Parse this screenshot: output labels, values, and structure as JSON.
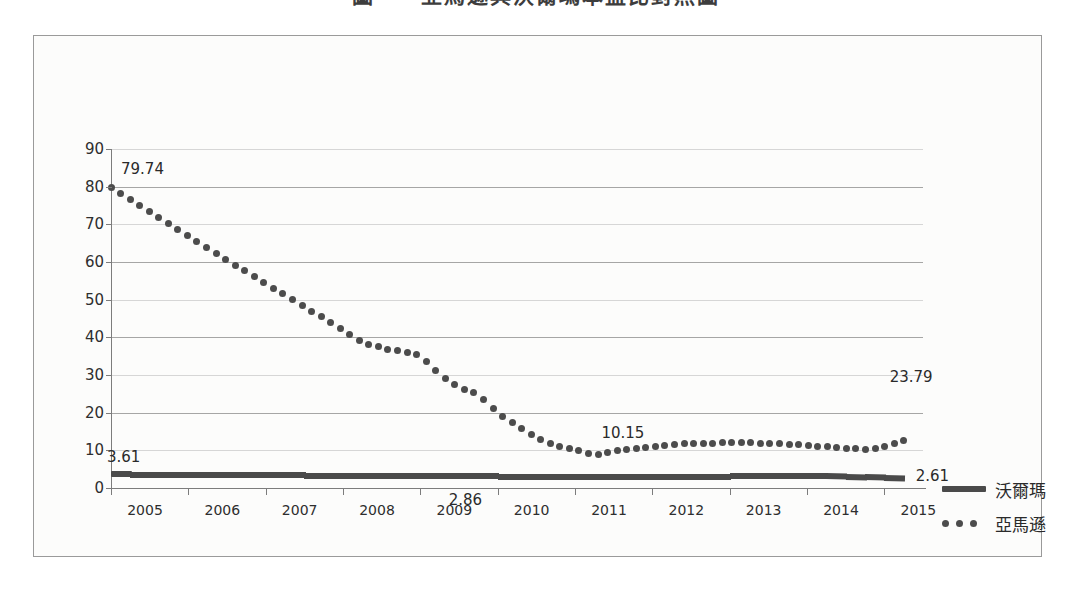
{
  "title": "圖一　亞馬遜與沃爾瑪本益比對照圖",
  "chart_data": {
    "type": "line",
    "title": "圖一　亞馬遜與沃爾瑪本益比對照圖",
    "xlabel": "",
    "ylabel": "",
    "ylim": [
      0,
      90
    ],
    "xlim": [
      2005,
      2015.5
    ],
    "grid": true,
    "legend_position": "right",
    "y_ticks": [
      0,
      10,
      20,
      30,
      40,
      50,
      60,
      70,
      80,
      90
    ],
    "x_ticks": [
      "2005",
      "2006",
      "2007",
      "2008",
      "2009",
      "2010",
      "2011",
      "2012",
      "2013",
      "2014",
      "2015"
    ],
    "x": [
      2005.0,
      2005.25,
      2005.5,
      2005.75,
      2006.0,
      2006.25,
      2006.5,
      2006.75,
      2007.0,
      2007.25,
      2007.5,
      2007.75,
      2008.0,
      2008.25,
      2008.5,
      2008.75,
      2009.0,
      2009.25,
      2009.5,
      2009.75,
      2010.0,
      2010.25,
      2010.5,
      2010.75,
      2011.0,
      2011.25,
      2011.5,
      2011.75,
      2012.0,
      2012.25,
      2012.5,
      2012.75,
      2013.0,
      2013.25,
      2013.5,
      2013.75,
      2014.0,
      2014.25,
      2014.5,
      2014.75,
      2015.0,
      2015.25
    ],
    "series": [
      {
        "name": "沃爾瑪",
        "style": "solid-thick",
        "values": [
          3.61,
          3.58,
          3.55,
          3.52,
          3.49,
          3.46,
          3.43,
          3.4,
          3.37,
          3.34,
          3.31,
          3.28,
          3.25,
          3.22,
          3.19,
          3.16,
          3.13,
          3.1,
          3.08,
          3.06,
          3.05,
          3.04,
          3.03,
          3.02,
          3.01,
          3.0,
          2.99,
          2.98,
          2.98,
          2.99,
          3.0,
          3.02,
          3.05,
          3.1,
          3.16,
          3.22,
          3.25,
          3.2,
          3.05,
          2.9,
          2.75,
          2.61
        ]
      },
      {
        "name": "亞馬遜",
        "style": "dotted",
        "values": [
          79.74,
          76.5,
          73.3,
          70.1,
          66.9,
          63.7,
          60.5,
          57.4,
          54.3,
          51.2,
          48.1,
          45.0,
          41.8,
          38.7,
          37.2,
          36.2,
          35.2,
          30.2,
          26.6,
          24.9,
          19.9,
          16.6,
          13.3,
          11.3,
          10.3,
          8.6,
          9.8,
          10.3,
          11.0,
          11.5,
          11.8,
          11.9,
          12.0,
          12.0,
          11.9,
          11.7,
          11.3,
          10.9,
          10.6,
          10.15,
          11.0,
          12.5
        ]
      }
    ],
    "annotations": [
      {
        "text": "79.74",
        "series": "亞馬遜",
        "x": 2005.0,
        "y": 79.74
      },
      {
        "text": "3.61",
        "series": "沃爾瑪",
        "x": 2005.0,
        "y": 3.61
      },
      {
        "text": "2.86",
        "series": "沃爾瑪",
        "x": 2009.6,
        "y": 2.86
      },
      {
        "text": "10.15",
        "series": "亞馬遜",
        "x": 2011.6,
        "y": 10.15
      },
      {
        "text": "23.79",
        "series": "亞馬遜",
        "x": 2015.25,
        "y": 23.79
      },
      {
        "text": "2.61",
        "series": "沃爾瑪",
        "x": 2015.25,
        "y": 2.61
      }
    ]
  },
  "legend": {
    "items": [
      {
        "label": "沃爾瑪",
        "marker": "solid-line"
      },
      {
        "label": "亞馬遜",
        "marker": "dotted-line"
      }
    ]
  }
}
